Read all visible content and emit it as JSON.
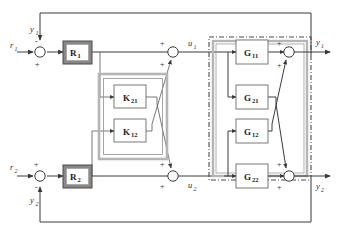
{
  "figure": {
    "type": "block-diagram"
  },
  "signals": {
    "ref1": {
      "base": "r",
      "sub": "1"
    },
    "ref2": {
      "base": "r",
      "sub": "2"
    },
    "out1_top": {
      "base": "y",
      "sub": "1"
    },
    "out2_bottom": {
      "base": "y",
      "sub": "2"
    },
    "out1_right": {
      "base": "y",
      "sub": "1"
    },
    "out2_right": {
      "base": "y",
      "sub": "2"
    },
    "ctrl1": {
      "base": "u",
      "sub": "1"
    },
    "ctrl2": {
      "base": "u",
      "sub": "2"
    }
  },
  "controllers": [
    {
      "name": "R1",
      "base": "R",
      "sub": "1"
    },
    {
      "name": "R2",
      "base": "R",
      "sub": "2"
    }
  ],
  "decouplers": [
    {
      "name": "K21",
      "base": "K",
      "sub": "21"
    },
    {
      "name": "K12",
      "base": "K",
      "sub": "12"
    }
  ],
  "plant": [
    {
      "name": "G11",
      "base": "G",
      "sub": "11"
    },
    {
      "name": "G21",
      "base": "G",
      "sub": "21"
    },
    {
      "name": "G12",
      "base": "G",
      "sub": "12"
    },
    {
      "name": "G22",
      "base": "G",
      "sub": "22"
    }
  ],
  "signs": {
    "sum1_minus": "-",
    "sum1_plus": "+",
    "sum2_plus": "+",
    "sum2_minus": "-",
    "u1_plus_top": "+",
    "u1_plus_bottom": "+",
    "u2_plus_top": "+",
    "u2_plus_bottom": "+",
    "y1_plus_top": "+",
    "y1_plus_bottom": "+",
    "y2_plus_top": "+",
    "y2_plus_bottom": "+"
  },
  "colors": {
    "wire": "#3a3a3a",
    "rblock_border": "#888888",
    "container_gray": "#b5b5b5",
    "block_fill": "#ffffff",
    "text": "#1a1a1a"
  }
}
